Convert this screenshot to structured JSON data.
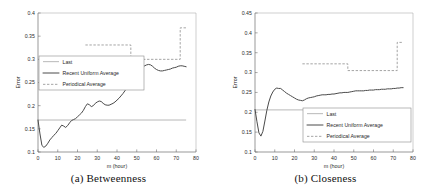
{
  "figure": {
    "panels": [
      {
        "id": "a",
        "caption": "(a) Betweenness",
        "chart_data": {
          "type": "line",
          "title": "",
          "xlabel": "m (hour)",
          "ylabel": "Error",
          "xlim": [
            0,
            80
          ],
          "ylim": [
            0.1,
            0.4
          ],
          "xticks": [
            0,
            10,
            20,
            30,
            40,
            50,
            60,
            70,
            80
          ],
          "xticklabels": [
            "0",
            "10",
            "20",
            "30",
            "40",
            "50",
            "60",
            "70",
            "80"
          ],
          "yticks": [
            0.1,
            0.15,
            0.2,
            0.25,
            0.3,
            0.35,
            0.4
          ],
          "yticklabels": [
            "0.1",
            "0.15",
            "0.2",
            "0.25",
            "0.3",
            "0.35",
            "0.4"
          ],
          "grid": false,
          "legend_position": "center-left",
          "series": [
            {
              "name": "Last",
              "style": "solid-light",
              "x": [
                0,
                75
              ],
              "values": [
                0.169,
                0.169
              ]
            },
            {
              "name": "Recent Uniform Average",
              "style": "solid-bold",
              "x": [
                0,
                1,
                2,
                3,
                4,
                5,
                6,
                7,
                8,
                9,
                10,
                11,
                12,
                13,
                14,
                15,
                16,
                17,
                18,
                19,
                20,
                21,
                22,
                23,
                24,
                25,
                26,
                27,
                28,
                29,
                30,
                31,
                32,
                33,
                34,
                35,
                36,
                37,
                38,
                39,
                40,
                41,
                42,
                43,
                44,
                45,
                46,
                47,
                48,
                49,
                50,
                51,
                52,
                53,
                54,
                55,
                56,
                57,
                58,
                59,
                60,
                61,
                62,
                63,
                64,
                65,
                66,
                67,
                68,
                69,
                70,
                71,
                72,
                73,
                74,
                75
              ],
              "values": [
                0.169,
                0.139,
                0.114,
                0.11,
                0.113,
                0.119,
                0.126,
                0.131,
                0.136,
                0.14,
                0.146,
                0.152,
                0.158,
                0.156,
                0.153,
                0.157,
                0.163,
                0.168,
                0.17,
                0.172,
                0.176,
                0.18,
                0.184,
                0.19,
                0.198,
                0.204,
                0.202,
                0.198,
                0.2,
                0.205,
                0.208,
                0.21,
                0.209,
                0.205,
                0.202,
                0.201,
                0.201,
                0.203,
                0.205,
                0.208,
                0.212,
                0.216,
                0.221,
                0.226,
                0.232,
                0.238,
                0.245,
                0.251,
                0.258,
                0.264,
                0.269,
                0.274,
                0.279,
                0.283,
                0.286,
                0.288,
                0.289,
                0.288,
                0.285,
                0.281,
                0.278,
                0.276,
                0.275,
                0.275,
                0.276,
                0.277,
                0.278,
                0.279,
                0.281,
                0.282,
                0.283,
                0.285,
                0.286,
                0.286,
                0.285,
                0.284
              ]
            },
            {
              "name": "Periodical Average",
              "style": "dashed",
              "x": [
                24,
                47,
                47,
                72,
                72,
                75
              ],
              "values": [
                0.331,
                0.331,
                0.3,
                0.3,
                0.368,
                0.368
              ]
            }
          ],
          "legend": [
            "Last",
            "Recent Uniform Average",
            "Periodical Average"
          ]
        }
      },
      {
        "id": "b",
        "caption": "(b) Closeness",
        "chart_data": {
          "type": "line",
          "title": "",
          "xlabel": "m (hour)",
          "ylabel": "Error",
          "xlim": [
            0,
            80
          ],
          "ylim": [
            0.1,
            0.45
          ],
          "xticks": [
            0,
            10,
            20,
            30,
            40,
            50,
            60,
            70,
            80
          ],
          "xticklabels": [
            "0",
            "10",
            "20",
            "30",
            "40",
            "50",
            "60",
            "70",
            "80"
          ],
          "yticks": [
            0.1,
            0.15,
            0.2,
            0.25,
            0.3,
            0.35,
            0.4,
            0.45
          ],
          "yticklabels": [
            "0.1",
            "0.15",
            "0.2",
            "0.25",
            "0.3",
            "0.35",
            "0.4",
            "0.45"
          ],
          "grid": false,
          "legend_position": "bottom-right",
          "series": [
            {
              "name": "Last",
              "style": "solid-light",
              "x": [
                0,
                75
              ],
              "values": [
                0.206,
                0.206
              ]
            },
            {
              "name": "Recent Uniform Average",
              "style": "solid-bold",
              "x": [
                0,
                1,
                2,
                3,
                4,
                5,
                6,
                7,
                8,
                9,
                10,
                11,
                12,
                13,
                14,
                15,
                16,
                17,
                18,
                19,
                20,
                21,
                22,
                23,
                24,
                25,
                26,
                27,
                28,
                29,
                30,
                31,
                32,
                33,
                34,
                35,
                36,
                37,
                38,
                39,
                40,
                41,
                42,
                43,
                44,
                45,
                46,
                47,
                48,
                49,
                50,
                51,
                52,
                53,
                54,
                55,
                56,
                57,
                58,
                59,
                60,
                61,
                62,
                63,
                64,
                65,
                66,
                67,
                68,
                69,
                70,
                71,
                72,
                73,
                74,
                75
              ],
              "values": [
                0.207,
                0.176,
                0.148,
                0.14,
                0.152,
                0.178,
                0.205,
                0.226,
                0.241,
                0.251,
                0.258,
                0.261,
                0.26,
                0.26,
                0.256,
                0.252,
                0.248,
                0.245,
                0.242,
                0.239,
                0.236,
                0.233,
                0.231,
                0.23,
                0.229,
                0.231,
                0.234,
                0.236,
                0.237,
                0.238,
                0.239,
                0.241,
                0.242,
                0.243,
                0.244,
                0.244,
                0.244,
                0.245,
                0.245,
                0.246,
                0.246,
                0.247,
                0.248,
                0.249,
                0.249,
                0.25,
                0.25,
                0.25,
                0.251,
                0.252,
                0.253,
                0.254,
                0.254,
                0.254,
                0.254,
                0.254,
                0.255,
                0.255,
                0.256,
                0.256,
                0.256,
                0.257,
                0.257,
                0.257,
                0.258,
                0.258,
                0.258,
                0.259,
                0.259,
                0.259,
                0.26,
                0.26,
                0.261,
                0.261,
                0.262,
                0.262
              ]
            },
            {
              "name": "Periodical Average",
              "style": "dashed",
              "x": [
                24,
                47,
                47,
                72,
                72,
                75
              ],
              "values": [
                0.322,
                0.322,
                0.305,
                0.305,
                0.376,
                0.376
              ]
            }
          ],
          "legend": [
            "Last",
            "Recent Uniform Average",
            "Periodical Average"
          ]
        }
      }
    ]
  },
  "colors": {
    "last": "#9a9a9a",
    "recent_uniform_average": "#4a4a4a",
    "periodical_average": "#8d8d8d",
    "axis": "#6f6f6f",
    "background": "#ffffff"
  }
}
